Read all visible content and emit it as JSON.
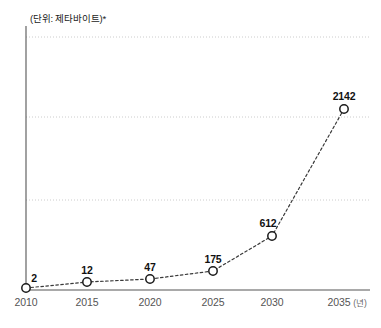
{
  "chart_data": {
    "type": "line",
    "title": "",
    "unit_note": "(단위: 제타바이트)*",
    "xlabel": "",
    "axis_unit_label": "(년)",
    "ylabel": "",
    "categories": [
      "2010",
      "2015",
      "2020",
      "2025",
      "2030",
      "2035"
    ],
    "values": [
      2,
      12,
      47,
      175,
      612,
      2142
    ],
    "point_labels": [
      "2",
      "12",
      "47",
      "175",
      "612",
      "2142"
    ],
    "tick_labels": [
      "2010",
      "2015",
      "2020",
      "2025",
      "2030",
      "2035"
    ],
    "last_tick_label": "2035",
    "ylim": [
      0,
      2400
    ],
    "xlim": [
      2010,
      2035
    ],
    "grid": true,
    "gridlines": [
      750,
      1500,
      2250
    ],
    "legend": [],
    "legend_position": "none",
    "series": [
      {
        "name": "제타바이트",
        "values": [
          2,
          12,
          47,
          175,
          612,
          2142
        ],
        "line_style": "dotted",
        "marker": "open-circle"
      }
    ],
    "colors": {
      "line": "#3a3a3a",
      "marker_stroke": "#1a1a1a",
      "marker_fill": "#ffffff",
      "axis": "#555555",
      "grid": "#cccccc",
      "label_text": "#111111",
      "tick_text": "#555555",
      "background": "#ffffff"
    }
  },
  "geometry": {
    "points": [
      {
        "x": 26,
        "y": 288,
        "label_x": 34,
        "label_y": 272
      },
      {
        "x": 87,
        "y": 282,
        "label_x": 87,
        "label_y": 264
      },
      {
        "x": 150,
        "y": 279,
        "label_x": 150,
        "label_y": 261
      },
      {
        "x": 213,
        "y": 271,
        "label_x": 213,
        "label_y": 253
      },
      {
        "x": 272,
        "y": 236,
        "label_x": 268,
        "label_y": 217
      },
      {
        "x": 344,
        "y": 109,
        "label_x": 344,
        "label_y": 90
      }
    ],
    "tick_x": [
      26,
      87,
      150,
      213,
      272,
      344
    ],
    "tick_label_y": 296,
    "gridline_y": [
      37,
      117,
      200
    ],
    "axis_x": 26,
    "axis_y": 290,
    "axis_top": 26,
    "axis_right": 370
  }
}
